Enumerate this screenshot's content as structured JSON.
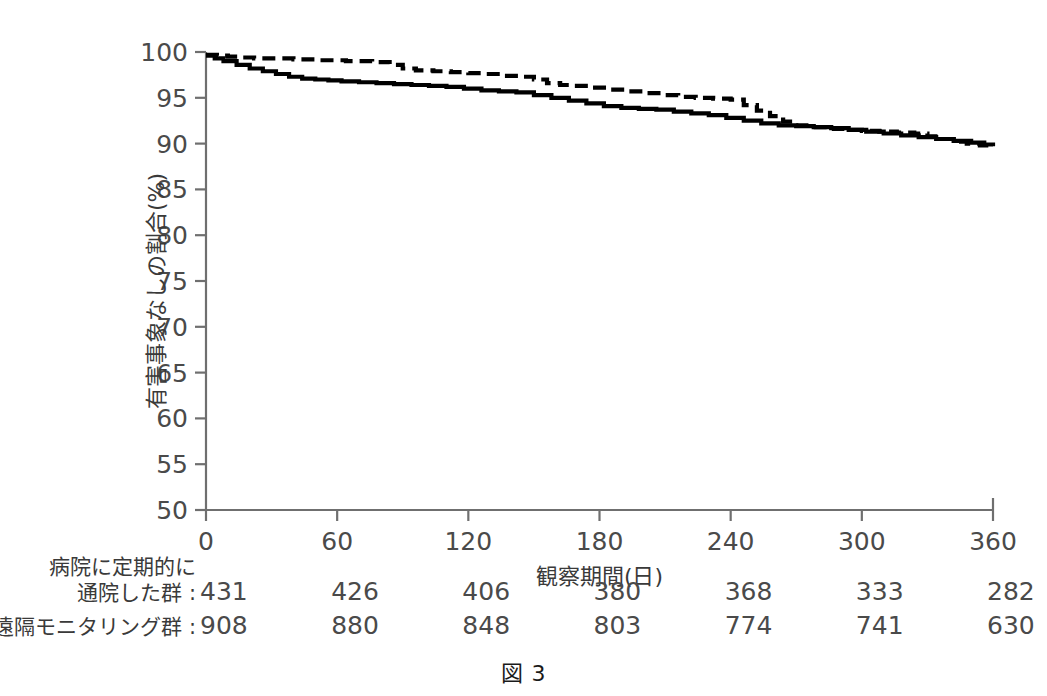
{
  "figure": {
    "caption": "図 3"
  },
  "chart_data": {
    "type": "line",
    "title": "",
    "xlabel": "観察期間(日)",
    "ylabel": "有害事象なしの割合(%)",
    "xlim": [
      0,
      360
    ],
    "ylim": [
      50,
      100
    ],
    "xticks": [
      0,
      60,
      120,
      180,
      240,
      300,
      360
    ],
    "yticks": [
      50,
      55,
      60,
      65,
      70,
      75,
      80,
      85,
      90,
      95,
      100
    ],
    "grid": false,
    "legend_position": "none",
    "series": [
      {
        "name": "遠隔モニタリング群",
        "style": "dashed",
        "color": "#000000",
        "x": [
          0,
          5,
          10,
          16,
          22,
          30,
          40,
          52,
          64,
          76,
          84,
          90,
          96,
          104,
          112,
          120,
          128,
          136,
          144,
          150,
          156,
          162,
          168,
          176,
          184,
          192,
          200,
          208,
          216,
          224,
          232,
          240,
          246,
          252,
          258,
          264,
          270,
          276,
          284,
          292,
          300,
          308,
          316,
          324,
          330,
          336,
          342,
          348,
          354,
          360
        ],
        "y": [
          99.7,
          99.6,
          99.5,
          99.4,
          99.3,
          99.3,
          99.2,
          99.1,
          99.0,
          98.9,
          98.6,
          98.2,
          98.0,
          97.9,
          97.8,
          97.7,
          97.6,
          97.4,
          97.3,
          97.0,
          96.6,
          96.4,
          96.3,
          96.1,
          95.9,
          95.7,
          95.5,
          95.3,
          95.1,
          95.0,
          94.9,
          94.8,
          94.2,
          93.6,
          93.0,
          92.4,
          92.0,
          91.8,
          91.6,
          91.5,
          91.4,
          91.3,
          91.2,
          91.1,
          90.8,
          90.5,
          90.2,
          90.0,
          89.8,
          89.6
        ]
      },
      {
        "name": "病院に定期的に通院した群",
        "style": "solid",
        "color": "#000000",
        "x": [
          0,
          4,
          8,
          14,
          20,
          26,
          32,
          38,
          44,
          50,
          56,
          62,
          70,
          78,
          86,
          94,
          102,
          110,
          118,
          126,
          134,
          142,
          150,
          158,
          166,
          174,
          182,
          190,
          198,
          206,
          214,
          222,
          230,
          238,
          246,
          254,
          262,
          270,
          278,
          286,
          294,
          302,
          310,
          318,
          326,
          334,
          342,
          350,
          356,
          360
        ],
        "y": [
          99.6,
          99.3,
          99.0,
          98.6,
          98.2,
          97.9,
          97.6,
          97.3,
          97.1,
          97.0,
          96.9,
          96.8,
          96.7,
          96.6,
          96.5,
          96.4,
          96.3,
          96.2,
          96.0,
          95.8,
          95.7,
          95.6,
          95.3,
          95.0,
          94.7,
          94.4,
          94.1,
          93.9,
          93.8,
          93.7,
          93.5,
          93.3,
          93.1,
          92.8,
          92.5,
          92.2,
          92.0,
          91.9,
          91.8,
          91.7,
          91.5,
          91.3,
          91.1,
          90.9,
          90.7,
          90.5,
          90.3,
          90.1,
          89.9,
          89.7
        ]
      }
    ]
  },
  "risk_table": {
    "times": [
      0,
      60,
      120,
      180,
      240,
      300,
      360
    ],
    "rows": [
      {
        "label_lines": [
          "病院に定期的に",
          "通院した群"
        ],
        "separator": ":",
        "values": [
          "431",
          "426",
          "406",
          "380",
          "368",
          "333",
          "282"
        ]
      },
      {
        "label_lines": [
          "遠隔モニタリング群"
        ],
        "separator": ":",
        "values": [
          "908",
          "880",
          "848",
          "803",
          "774",
          "741",
          "630"
        ]
      }
    ]
  }
}
